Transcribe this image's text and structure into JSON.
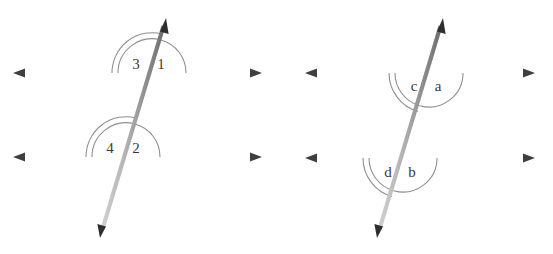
{
  "diagram": {
    "type": "geometry-angle-diagram",
    "background_color": "#ffffff",
    "figures": [
      {
        "id": "figure-left",
        "name": "numbered-angle-figure",
        "label_set": "numeric",
        "parallel_lines": [
          {
            "id": "top-line",
            "name": "upper-parallel-line",
            "y": 73,
            "x_start": 13,
            "x_end": 262,
            "left_color": "#c9c9c9",
            "right_color": "#8a8a8a",
            "arrow_left": true,
            "arrow_right": true
          },
          {
            "id": "bottom-line",
            "name": "lower-parallel-line",
            "y": 157,
            "x_start": 13,
            "x_end": 262,
            "left_color": "#c9c9c9",
            "right_color": "#8a8a8a",
            "arrow_left": true,
            "arrow_right": true
          }
        ],
        "transversal": {
          "id": "transversal-left",
          "name": "transversal-line",
          "x_top": 166,
          "y_top": 18,
          "x_bottom": 100,
          "y_bottom": 238,
          "color_light": "#c0c0c0",
          "color_dark": "#6e6e6e",
          "arrow_top": true,
          "arrow_bottom": true
        },
        "angles": [
          {
            "id": "angle-3",
            "label": "3",
            "arcs": 2,
            "position": "above-left",
            "vertex": "top",
            "label_x": 136,
            "label_y": 66
          },
          {
            "id": "angle-1",
            "label": "1",
            "arcs": 1,
            "position": "above-right",
            "vertex": "top",
            "label_x": 161,
            "label_y": 66
          },
          {
            "id": "angle-4",
            "label": "4",
            "arcs": 2,
            "position": "above-left",
            "vertex": "bottom",
            "label_x": 110,
            "label_y": 150
          },
          {
            "id": "angle-2",
            "label": "2",
            "arcs": 1,
            "position": "above-right",
            "vertex": "bottom",
            "label_x": 136,
            "label_y": 150
          }
        ]
      },
      {
        "id": "figure-right",
        "name": "lettered-angle-figure",
        "label_set": "alphabetic",
        "parallel_lines": [
          {
            "id": "top-line",
            "name": "upper-parallel-line",
            "y": 73,
            "x_start": 305,
            "x_end": 535,
            "left_color": "#c9c9c9",
            "right_color": "#8a8a8a",
            "arrow_left": true,
            "arrow_right": true
          },
          {
            "id": "bottom-line",
            "name": "lower-parallel-line",
            "y": 158,
            "x_start": 305,
            "x_end": 535,
            "left_color": "#c9c9c9",
            "right_color": "#8a8a8a",
            "arrow_left": true,
            "arrow_right": true
          }
        ],
        "transversal": {
          "id": "transversal-right",
          "name": "transversal-line",
          "x_top": 443,
          "y_top": 18,
          "x_bottom": 377,
          "y_bottom": 238,
          "color_light": "#c0c0c0",
          "color_dark": "#6e6e6e",
          "arrow_top": true,
          "arrow_bottom": true
        },
        "angles": [
          {
            "id": "angle-c",
            "label": "c",
            "arcs": 2,
            "position": "below-left",
            "vertex": "top",
            "label_x": 414,
            "label_y": 88
          },
          {
            "id": "angle-a",
            "label": "a",
            "arcs": 1,
            "position": "below-right",
            "vertex": "top",
            "label_x": 438,
            "label_y": 88
          },
          {
            "id": "angle-d",
            "label": "d",
            "arcs": 2,
            "position": "below-left",
            "vertex": "bottom",
            "label_x": 388,
            "label_y": 174
          },
          {
            "id": "angle-b",
            "label": "b",
            "arcs": 1,
            "position": "below-right",
            "vertex": "bottom",
            "label_x": 412,
            "label_y": 174
          }
        ]
      }
    ],
    "colors": {
      "arc_stroke": "#8f8f8f",
      "label_text": "#3a3a3a",
      "arrow_fill": "#3f3f3f",
      "line_light": "#c9c9c9",
      "line_dark": "#8a8a8a"
    }
  }
}
